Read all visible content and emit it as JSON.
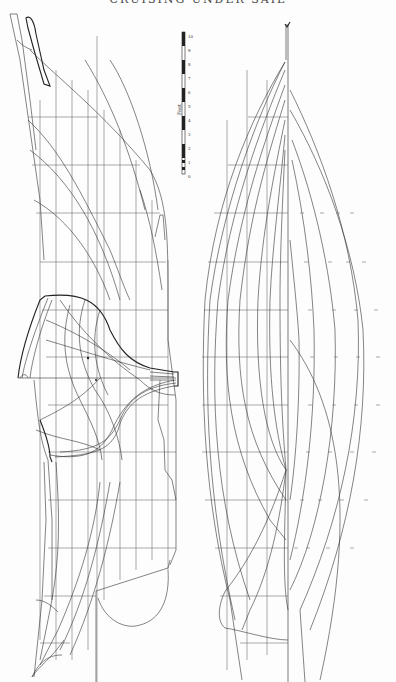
{
  "page": {
    "header": "CRUISING UNDER SAIL",
    "orientation": "rotated 90 degrees (landscape drawing on portrait page)"
  },
  "drawings": {
    "profile_and_body_plan": {
      "label": "Sheer / profile with body plan (sections)",
      "position": "left"
    },
    "half_breadth_plan": {
      "label": "Half-breadth plan (waterlines)",
      "position": "right"
    }
  },
  "scale_bar": {
    "unit_label": "Feet",
    "ticks": [
      "10",
      "9",
      "8",
      "7",
      "6",
      "5",
      "4",
      "3",
      "2",
      "1",
      "0",
      "1"
    ]
  },
  "grid": {
    "profile_stations_x": [
      40,
      56,
      72,
      88,
      104,
      120,
      136,
      152,
      168
    ],
    "profile_waterlines_y": [
      100,
      147,
      195,
      243,
      290,
      337,
      385,
      432,
      480,
      527,
      575,
      620
    ],
    "half_breadth_rows_y": [
      117,
      165,
      213,
      262,
      310,
      357,
      405,
      452,
      500,
      548,
      596,
      643
    ]
  }
}
